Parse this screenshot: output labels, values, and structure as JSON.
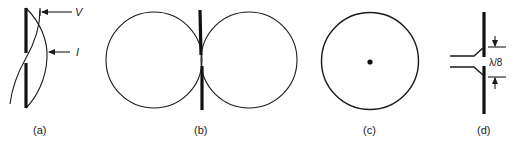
{
  "figure": {
    "panels": [
      {
        "id": "a",
        "label": "(a)",
        "description": "Half-wave dipole with voltage and current distributions",
        "annotations": {
          "voltage": "V",
          "current": "I"
        }
      },
      {
        "id": "b",
        "label": "(b)",
        "description": "Figure-eight radiation pattern in plane containing the dipole"
      },
      {
        "id": "c",
        "label": "(c)",
        "description": "Omnidirectional circular pattern in plane perpendicular to the dipole"
      },
      {
        "id": "d",
        "label": "(d)",
        "description": "Dipole fed by transmission line with feed gap",
        "dimension": "λ/8"
      }
    ]
  }
}
